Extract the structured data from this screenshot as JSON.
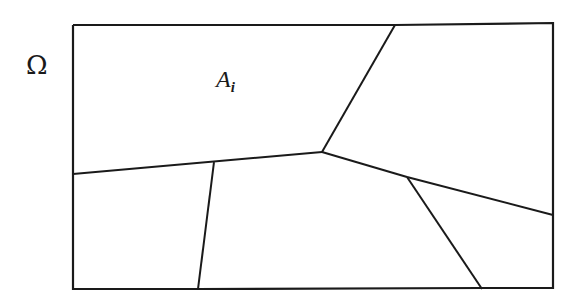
{
  "domain_label": {
    "symbol": "Ω"
  },
  "region_label": {
    "base": "A",
    "subscript": "i"
  },
  "colors": {
    "stroke": "#1a1a1a",
    "background": "#ffffff"
  },
  "diagram": {
    "boundary": {
      "x1": 73,
      "y1": 25,
      "x2": 553,
      "y2": 289
    },
    "edges": [
      {
        "from": [
          73,
          174
        ],
        "to": [
          322,
          152
        ]
      },
      {
        "from": [
          395,
          25
        ],
        "to": [
          322,
          152
        ]
      },
      {
        "from": [
          214,
          162
        ],
        "to": [
          198,
          289
        ]
      },
      {
        "from": [
          322,
          152
        ],
        "to": [
          407,
          177
        ]
      },
      {
        "from": [
          407,
          177
        ],
        "to": [
          553,
          215
        ]
      },
      {
        "from": [
          407,
          177
        ],
        "to": [
          482,
          289
        ]
      }
    ]
  }
}
